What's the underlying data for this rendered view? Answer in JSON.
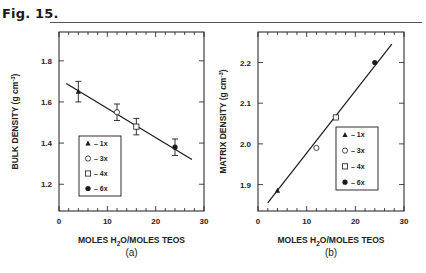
{
  "figure": {
    "title": "Fig. 15.",
    "panels": [
      "(a)",
      "(b)"
    ]
  },
  "chart_data": [
    {
      "type": "scatter",
      "panel": "(a)",
      "title": "",
      "xlabel": "MOLES H2O/MOLES TEOS",
      "ylabel": "BULK DENSITY (g cm-3)",
      "xlim": [
        0,
        30
      ],
      "ylim": [
        1.07,
        1.94
      ],
      "xticks": [
        "0",
        "10",
        "20",
        "30"
      ],
      "yticks": [
        "1.2",
        "1.4",
        "1.6",
        "1.8"
      ],
      "grid": false,
      "legend_position": "lower left",
      "legend": [
        {
          "marker": "filled-triangle",
          "label": "– 1x"
        },
        {
          "marker": "open-circle",
          "label": "– 3x"
        },
        {
          "marker": "open-square",
          "label": "– 4x"
        },
        {
          "marker": "filled-circle",
          "label": "– 6x"
        }
      ],
      "series": [
        {
          "name": "1x",
          "marker": "filled-triangle",
          "x": [
            4
          ],
          "y": [
            1.65
          ],
          "yerr": [
            0.05
          ]
        },
        {
          "name": "3x",
          "marker": "open-circle",
          "x": [
            12
          ],
          "y": [
            1.55
          ],
          "yerr": [
            0.04
          ]
        },
        {
          "name": "4x",
          "marker": "open-square",
          "x": [
            16
          ],
          "y": [
            1.48
          ],
          "yerr": [
            0.04
          ]
        },
        {
          "name": "6x",
          "marker": "filled-circle",
          "x": [
            24
          ],
          "y": [
            1.38
          ],
          "yerr": [
            0.04
          ]
        }
      ],
      "fit_line": {
        "x": [
          1.5,
          27.5
        ],
        "y": [
          1.69,
          1.32
        ]
      }
    },
    {
      "type": "scatter",
      "panel": "(b)",
      "title": "",
      "xlabel": "MOLES H2O/MOLES TEOS",
      "ylabel": "MATRIX DENSITY (g cm-3)",
      "xlim": [
        0,
        30
      ],
      "ylim": [
        1.835,
        2.275
      ],
      "xticks": [
        "0",
        "10",
        "20",
        "30"
      ],
      "yticks": [
        "1.9",
        "2.0",
        "2.1",
        "2.2"
      ],
      "grid": false,
      "legend_position": "lower right",
      "legend": [
        {
          "marker": "filled-triangle",
          "label": "– 1x"
        },
        {
          "marker": "open-circle",
          "label": "– 3x"
        },
        {
          "marker": "open-square",
          "label": "– 4x"
        },
        {
          "marker": "filled-circle",
          "label": "– 6x"
        }
      ],
      "series": [
        {
          "name": "1x",
          "marker": "filled-triangle",
          "x": [
            4
          ],
          "y": [
            1.885
          ]
        },
        {
          "name": "3x",
          "marker": "open-circle",
          "x": [
            12
          ],
          "y": [
            1.99
          ]
        },
        {
          "name": "4x",
          "marker": "open-square",
          "x": [
            16
          ],
          "y": [
            2.065
          ]
        },
        {
          "name": "6x",
          "marker": "filled-circle",
          "x": [
            24
          ],
          "y": [
            2.2
          ]
        }
      ],
      "fit_line": {
        "x": [
          2,
          27.5
        ],
        "y": [
          1.855,
          2.245
        ]
      }
    }
  ]
}
